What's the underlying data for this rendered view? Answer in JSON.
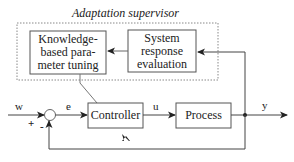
{
  "diagram": {
    "type": "adaptive control block diagram",
    "supervisor": {
      "title": "Adaptation supervisor",
      "blocks": [
        {
          "id": "knowledge",
          "lines": [
            "Knowledge-",
            "based para-",
            "meter tuning"
          ]
        },
        {
          "id": "evaluation",
          "lines": [
            "System",
            "response",
            "evaluation"
          ]
        }
      ]
    },
    "main_loop": {
      "blocks": [
        {
          "id": "controller",
          "label": "Controller"
        },
        {
          "id": "process",
          "label": "Process"
        }
      ],
      "signals": {
        "reference": "w",
        "error": "e",
        "control": "u",
        "output": "y"
      },
      "summing_junction": {
        "plus": "+",
        "minus": "-"
      }
    },
    "edges": [
      {
        "from": "w",
        "to": "summing_junction",
        "sign": "+"
      },
      {
        "from": "summing_junction",
        "to": "controller",
        "label": "e"
      },
      {
        "from": "controller",
        "to": "process",
        "label": "u"
      },
      {
        "from": "process",
        "to": "output",
        "label": "y"
      },
      {
        "from": "output",
        "to": "summing_junction",
        "sign": "-"
      },
      {
        "from": "output",
        "to": "evaluation"
      },
      {
        "from": "evaluation",
        "to": "knowledge"
      },
      {
        "from": "knowledge",
        "to": "controller",
        "style": "parameter adjustment"
      }
    ],
    "colors": {
      "line": "#222222",
      "dashed_border": "#888888",
      "background": "#ffffff"
    }
  }
}
